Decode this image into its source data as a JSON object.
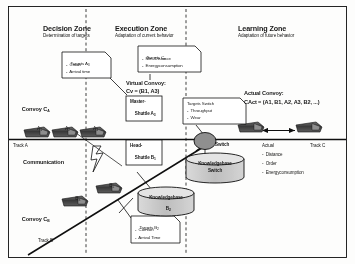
{
  "diagram": {
    "zones": [
      {
        "name": "decision",
        "title": "Decision Zone",
        "subtitle": "Determination of targets"
      },
      {
        "name": "execution",
        "title": "Execution Zone",
        "subtitle": "Adaptation of current behavior"
      },
      {
        "name": "learning",
        "title": "Learning Zone",
        "subtitle": "Adaptation of future behavior"
      }
    ],
    "callouts": [
      {
        "name": "targets-a3",
        "header": "Targets A",
        "header_sub": "3",
        "items": [
          "-  Crash",
          "-  Arrival time"
        ]
      },
      {
        "name": "targets-cv",
        "header": "Targets C",
        "header_sub": "v",
        "items": [
          "-  Min. Distance",
          "-  Energyconsumption"
        ]
      },
      {
        "name": "targets-switch",
        "header": "Targets Switch",
        "header_sub": "",
        "items": [
          "-  Throughput",
          "-  Wear"
        ]
      },
      {
        "name": "targets-b2",
        "header": "Targets B",
        "header_sub": "2",
        "items": [
          "-  Comfort",
          "-  Arrival Time"
        ]
      }
    ],
    "convoys": {
      "convoy_a_label": "Convoy C",
      "convoy_a_sub": "A",
      "convoy_b_label": "Convoy C",
      "convoy_b_sub": "B",
      "virtual_title": "Virtual Convoy:",
      "virtual_formula": "C",
      "virtual_formula_sub": "v",
      "virtual_formula_rest": " = (B , A )",
      "virtual_formula_full": "Cv = (B1, A3)",
      "actual_title": "Actual Convoy:",
      "actual_formula_full": "CAct = (A1, B1, A2, A3, B2, ...)"
    },
    "shuttles": [
      {
        "name": "shuttle-a1",
        "label": "A",
        "sub": "1"
      },
      {
        "name": "shuttle-a2",
        "label": "A",
        "sub": "2"
      },
      {
        "name": "shuttle-a3",
        "label": "A",
        "sub": "3"
      },
      {
        "name": "shuttle-b1",
        "label": "B",
        "sub": "1"
      },
      {
        "name": "shuttle-b2",
        "label": "B",
        "sub": "2"
      },
      {
        "name": "shuttle-b3",
        "label": "B",
        "sub": "3"
      }
    ],
    "roles": {
      "master_line1": "Master-",
      "master_line2": "Shuttle A",
      "master_sub": "3",
      "head_line1": "Head-",
      "head_line2": "Shuttle B",
      "head_sub": "1"
    },
    "tracks": [
      {
        "name": "track-a",
        "label": "Track A"
      },
      {
        "name": "track-b",
        "label": "Track B"
      },
      {
        "name": "track-c",
        "label": "Track C"
      }
    ],
    "communication_label": "Communication",
    "switch_label": "Switch",
    "knowledgebases": [
      {
        "name": "kb-b2",
        "line1": "Knowledgebase",
        "line2": "B",
        "sub": "2"
      },
      {
        "name": "kb-switch",
        "line1": "Knowledgebase",
        "line2": "Switch",
        "sub": ""
      }
    ],
    "actual_list": {
      "header": "Actual",
      "items": [
        "-  Distance",
        "-  Order",
        "-  Energyconsumption"
      ]
    },
    "colors": {
      "ink": "#1a1a1a",
      "shuttle": "#4a4a4a",
      "kb_fill": "#c9c9c9",
      "switch_fill": "#9a9a9a",
      "line": "#000000"
    }
  }
}
